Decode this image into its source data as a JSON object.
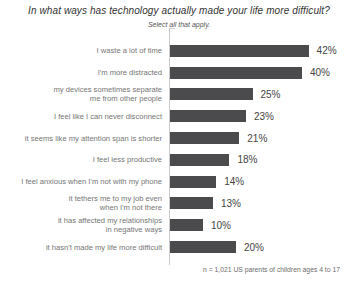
{
  "header": {
    "title": "In what ways has technology actually made your life more difficult?",
    "subtitle": "Select all that apply."
  },
  "footnote": "n = 1,021 US parents of children ages 4 to 17",
  "chart_data": {
    "type": "bar",
    "orientation": "horizontal",
    "title": "In what ways has technology actually made your life more difficult?",
    "subtitle": "Select all that apply.",
    "categories": [
      "I waste a lot of time",
      "I'm more distracted",
      "my devices sometimes separate\nme from other people",
      "I feel like I can never disconnect",
      "it seems like my attention span is shorter",
      "I feel less productive",
      "I feel anxious when I'm not with my phone",
      "it tethers me to my job even\nwhen I'm not there",
      "it has affected my relationships\nin negative ways",
      "it hasn't made my life more difficult"
    ],
    "values": [
      42,
      40,
      25,
      23,
      21,
      18,
      14,
      13,
      10,
      20
    ],
    "unit": "%",
    "value_labels": [
      "42%",
      "40%",
      "25%",
      "23%",
      "21%",
      "18%",
      "14%",
      "13%",
      "10%",
      "20%"
    ],
    "xlabel": "",
    "ylabel": "",
    "xlim": [
      0,
      45
    ],
    "grid": false,
    "legend": false,
    "bar_color": "#4b4b4d",
    "axis_color": "#cccccc",
    "px_per_percent": 3.3
  }
}
